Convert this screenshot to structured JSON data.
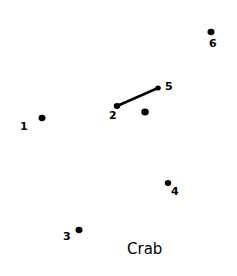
{
  "title": "Crab",
  "dots": [
    {
      "label": "1",
      "x": 42,
      "y": 118,
      "lx": 20,
      "ly": 130,
      "r": 3.5
    },
    {
      "label": "2",
      "x": 117,
      "y": 106,
      "lx": 109,
      "ly": 119,
      "r": 3.2
    },
    {
      "label": "3",
      "x": 79,
      "y": 230,
      "lx": 63,
      "ly": 240,
      "r": 3.5
    },
    {
      "label": "4",
      "x": 168,
      "y": 183,
      "lx": 171,
      "ly": 195,
      "r": 3.2
    },
    {
      "label": "5",
      "x": 158,
      "y": 88,
      "lx": 165,
      "ly": 90,
      "r": 2.8
    },
    {
      "label": "6",
      "x": 211,
      "y": 32,
      "lx": 209,
      "ly": 47,
      "r": 3.5
    },
    {
      "label": "",
      "x": 145,
      "y": 112,
      "lx": 0,
      "ly": 0,
      "r": 3.8
    }
  ],
  "lines": [
    {
      "from": "2",
      "to": "5"
    }
  ],
  "title_pos": {
    "x": 127,
    "y": 254
  },
  "colors": {
    "ink": "#000000",
    "background": "#ffffff"
  }
}
